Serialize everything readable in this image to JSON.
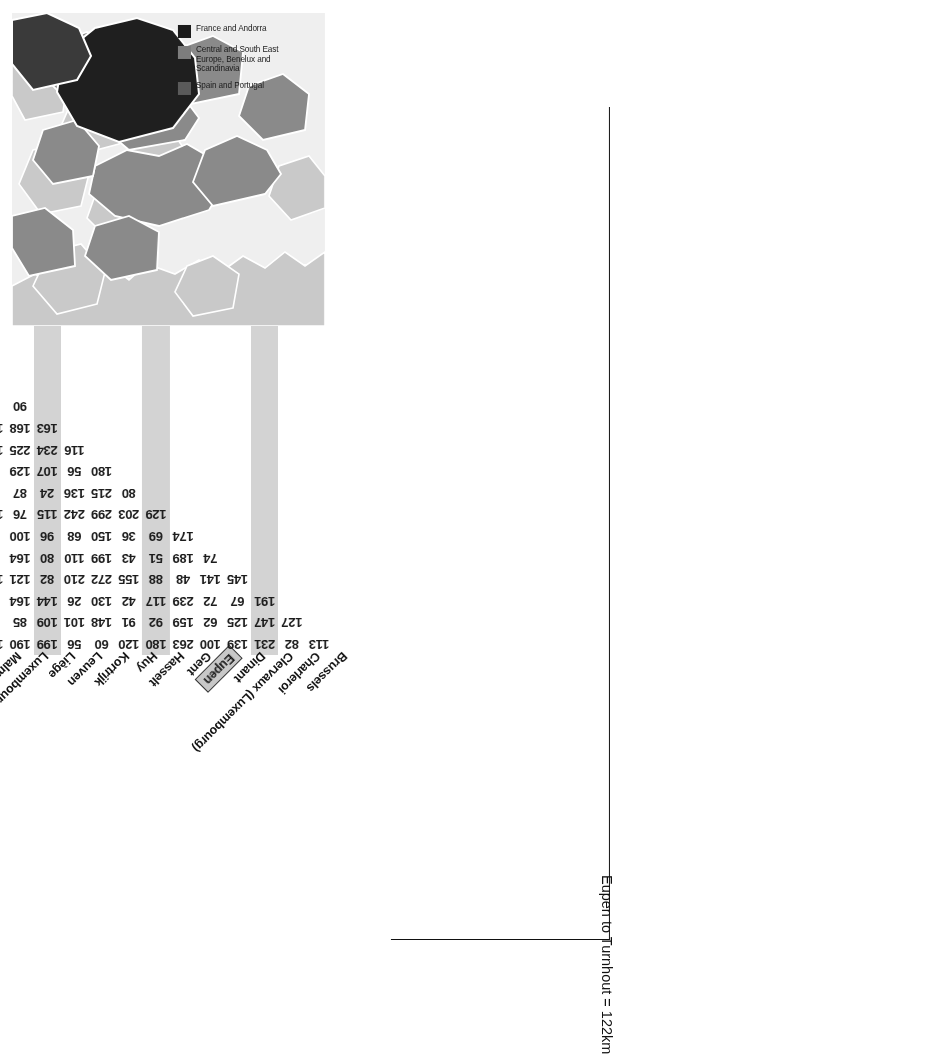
{
  "annotation": {
    "callout_text": "Eupen to Turnhout = 122km"
  },
  "map": {
    "legend": [
      {
        "label": "France and Andorra",
        "color": "#1a1a1a"
      },
      {
        "label": "Central and South East Europe, Benelux and Scandinavia",
        "color": "#7d7d7d"
      },
      {
        "label": "Spain and Portugal",
        "color": "#5a5a5a"
      }
    ],
    "colors": {
      "sea": "#efefef",
      "land_light": "#c9c9c9",
      "land_mid": "#8a8a8a",
      "land_dark": "#1f1f1f",
      "border": "#ffffff"
    }
  },
  "chart_data": {
    "type": "table",
    "highlight": {
      "row": "Turnhout",
      "column": "Eupen",
      "value": 122
    },
    "columns": [
      "Charleroi",
      "Clervaux (Luxembourg)",
      "Dinant",
      "Eupen",
      "Gent",
      "Hasselt",
      "Huy",
      "Kortrijk",
      "Leuven",
      "Liège",
      "Luxembourg City",
      "Malmedy",
      "Mechelen",
      "Mons",
      "Namur",
      "Oostende",
      "Oudenaarde",
      "Philippeville",
      "Tournai",
      "Turnhout",
      "Ypres",
      "Zeebrugge"
    ],
    "column_leftmost_partial": "Brussels",
    "rows": [
      {
        "label": "Clervaux (Luxembourg)",
        "values": [
          113,
          null,
          127,
          191,
          145,
          null,
          null,
          null,
          null,
          180,
          null,
          null,
          null,
          null,
          null,
          null,
          null,
          null,
          null,
          null,
          null,
          null
        ]
      },
      {
        "label": "Dinant",
        "values": [
          82,
          127,
          null,
          67,
          141,
          74,
          174,
          129,
          80,
          56,
          116,
          163,
          90,
          72,
          179,
          86,
          138,
          119,
          174,
          176,
          68,
          null
        ]
      },
      {
        "label": "Eupen",
        "values": [
          231,
          147,
          125,
          72,
          48,
          189,
          69,
          203,
          215,
          107,
          234,
          168,
          81,
          140,
          137,
          193,
          37,
          185,
          58,
          167,
          null,
          null
        ]
      },
      {
        "label": "Gent",
        "values": [
          139,
          125,
          62,
          239,
          88,
          51,
          36,
          299,
          136,
          129,
          225,
          102,
          137,
          67,
          62,
          91,
          127,
          175,
          113,
          null,
          null,
          null
        ]
      },
      {
        "label": "Hasselt",
        "values": [
          100,
          62,
          159,
          117,
          155,
          43,
          150,
          242,
          24,
          62,
          155,
          268,
          96,
          72,
          120,
          170,
          65,
          195,
          null,
          null,
          null,
          null
        ]
      },
      {
        "label": "Huy",
        "values": [
          263,
          159,
          92,
          42,
          272,
          199,
          68,
          115,
          87,
          214,
          329,
          226,
          115,
          48,
          146,
          56,
          86,
          null,
          null,
          null,
          null,
          null
        ]
      },
      {
        "label": "Kortrijk",
        "values": [
          180,
          92,
          91,
          130,
          210,
          110,
          96,
          76,
          62,
          172,
          310,
          130,
          116,
          160,
          175,
          25,
          null,
          null,
          null,
          null,
          null,
          null
        ]
      },
      {
        "label": "Leuven",
        "values": [
          120,
          91,
          148,
          26,
          82,
          80,
          100,
          144,
          144,
          119,
          177,
          242,
          54,
          106,
          177,
          null,
          null,
          null,
          null,
          null,
          null,
          null
        ]
      },
      {
        "label": "Liège",
        "values": [
          60,
          148,
          101,
          144,
          121,
          164,
          34,
          62,
          103,
          175,
          270,
          166,
          146,
          151,
          null,
          null,
          null,
          null,
          null,
          null,
          null,
          null
        ]
      },
      {
        "label": "Luxembourg City",
        "values": [
          56,
          101,
          109,
          164,
          120,
          97,
          198,
          35,
          94,
          105,
          304,
          272,
          137,
          null,
          null,
          null,
          null,
          null,
          null,
          null,
          null,
          null
        ]
      },
      {
        "label": "Malmedy",
        "values": [
          199,
          109,
          85,
          99,
          70,
          202,
          165,
          146,
          112,
          232,
          328,
          263,
          null,
          null,
          null,
          null,
          null,
          null,
          null,
          null,
          null,
          null
        ]
      },
      {
        "label": "Mechelen",
        "values": [
          190,
          85,
          28,
          249,
          29,
          197,
          91,
          29,
          161,
          212,
          331,
          null,
          null,
          null,
          null,
          null,
          null,
          null,
          null,
          null,
          null,
          null
        ]
      },
      {
        "label": "Mons",
        "values": [
          120,
          28,
          205,
          207,
          136,
          156,
          148,
          147,
          143,
          null,
          null,
          null,
          null,
          null,
          null,
          null,
          null,
          null,
          null,
          null,
          null,
          null
        ]
      },
      {
        "label": "Namur",
        "values": [
          294,
          205,
          164,
          155,
          71,
          211,
          171,
          74,
          null,
          null,
          null,
          null,
          null,
          null,
          null,
          null,
          null,
          null,
          null,
          null,
          null,
          null
        ]
      },
      {
        "label": "Oostende",
        "values": [
          255,
          164,
          30,
          211,
          106,
          55,
          205,
          null,
          null,
          null,
          null,
          null,
          null,
          null,
          null,
          null,
          null,
          null,
          null,
          null,
          null,
          null
        ]
      },
      {
        "label": "Oudenaarde",
        "values": [
          142,
          30,
          131,
          122,
          78,
          217,
          197,
          null,
          null,
          null,
          null,
          null,
          null,
          null,
          null,
          null,
          null,
          null,
          null,
          null,
          null,
          null
        ]
      },
      {
        "label": "Philippeville",
        "values": [
          235,
          131,
          177,
          269,
          201,
          156,
          null,
          null,
          null,
          null,
          null,
          null,
          null,
          null,
          null,
          null,
          null,
          null,
          null,
          null,
          null,
          null
        ]
      },
      {
        "label": "Tournai",
        "values": [
          344,
          177,
          189,
          70,
          null,
          null,
          null,
          null,
          null,
          null,
          null,
          null,
          null,
          null,
          null,
          null,
          null,
          null,
          null,
          null,
          null,
          null
        ]
      },
      {
        "label": "Turnhout",
        "values": [
          293,
          189,
          205,
          null,
          null,
          null,
          null,
          null,
          null,
          null,
          null,
          null,
          null,
          null,
          null,
          null,
          null,
          null,
          null,
          null,
          null,
          null
        ]
      },
      {
        "label": "Ypres",
        "values": [
          263,
          205,
          null,
          null,
          null,
          null,
          null,
          null,
          null,
          null,
          null,
          null,
          null,
          null,
          null,
          null,
          null,
          null,
          null,
          null,
          null,
          null
        ]
      }
    ],
    "matrix_render": [
      [
        "",
        "113",
        "82",
        "231",
        "139",
        "100",
        "263",
        "180",
        "120",
        "60",
        "56",
        "199",
        "190",
        "120",
        "294",
        "255",
        "142",
        "235",
        "344",
        "293",
        "263"
      ],
      [
        "",
        "",
        "127",
        "147",
        "125",
        "62",
        "159",
        "92",
        "91",
        "148",
        "101",
        "109",
        "85",
        "28",
        "205",
        "164",
        "30",
        "131",
        "177",
        "189",
        "205"
      ],
      [
        "",
        "",
        "",
        "191",
        "67",
        "72",
        "239",
        "117",
        "42",
        "130",
        "26",
        "144",
        "164",
        "99",
        "249",
        "207",
        "155",
        "211",
        "122",
        "269",
        "70"
      ],
      [
        "",
        "",
        "",
        "",
        "145",
        "141",
        "48",
        "88",
        "155",
        "272",
        "210",
        "82",
        "121",
        "120",
        "70",
        "29",
        "136",
        "71",
        "106",
        "78",
        "201"
      ],
      [
        "",
        "",
        "",
        "",
        "",
        "74",
        "189",
        "51",
        "43",
        "199",
        "110",
        "80",
        "164",
        "97",
        "202",
        "197",
        "156",
        "211",
        "55",
        "217",
        "156"
      ],
      [
        "",
        "",
        "",
        "",
        "",
        "",
        "174",
        "69",
        "36",
        "150",
        "68",
        "96",
        "100",
        "34",
        "198",
        "165",
        "91",
        "148",
        "171",
        "205",
        "197"
      ],
      [
        "",
        "",
        "",
        "",
        "",
        "",
        "",
        "129",
        "203",
        "299",
        "242",
        "115",
        "76",
        "144",
        "62",
        "35",
        "146",
        "29",
        "147",
        "29",
        "74"
      ],
      [
        "",
        "",
        "",
        "",
        "",
        "",
        "",
        "",
        "80",
        "215",
        "136",
        "24",
        "87",
        "62",
        "144",
        "103",
        "94",
        "134",
        "112",
        "161",
        "143"
      ],
      [
        "",
        "",
        "",
        "",
        "",
        "",
        "",
        "",
        "",
        "180",
        "56",
        "107",
        "129",
        "62",
        "214",
        "172",
        "119",
        "175",
        "105",
        "232",
        "212"
      ],
      [
        "",
        "",
        "",
        "",
        "",
        "",
        "",
        "",
        "",
        "",
        "116",
        "234",
        "225",
        "155",
        "329",
        "310",
        "177",
        "270",
        "304",
        "328",
        "331"
      ],
      [
        "",
        "",
        "",
        "",
        "",
        "",
        "",
        "",
        "",
        "",
        "",
        "163",
        "168",
        "102",
        "268",
        "226",
        "130",
        "242",
        "166",
        "272",
        "263"
      ],
      [
        "",
        "",
        "",
        "",
        "",
        "",
        "",
        "",
        "",
        "",
        "",
        "",
        "90",
        "81",
        "137",
        "96",
        "115",
        "116",
        "54",
        "146",
        "137"
      ],
      [
        "",
        "",
        "",
        "",
        "",
        "",
        "",
        "",
        "",
        "",
        "",
        "",
        "",
        "72",
        "140",
        "67",
        "72",
        "48",
        "160",
        "106",
        "151"
      ],
      [
        "",
        "",
        "",
        "",
        "",
        "",
        "",
        "",
        "",
        "",
        "",
        "",
        "",
        "",
        "179",
        "137",
        "62",
        "120",
        "146",
        "175",
        "177"
      ],
      [
        "",
        "",
        "",
        "",
        "",
        "",
        "",
        "",
        "",
        "",
        "",
        "",
        "",
        "",
        "",
        "86",
        "193",
        "91",
        "170",
        "56",
        "25"
      ],
      [
        "",
        "",
        "",
        "",
        "",
        "",
        "",
        "",
        "",
        "",
        "",
        "",
        "",
        "",
        "",
        "",
        "138",
        "37",
        "127",
        "65",
        "86"
      ],
      [
        "",
        "",
        "",
        "",
        "",
        "",
        "",
        "",
        "",
        "",
        "",
        "",
        "",
        "",
        "",
        "",
        "",
        "119",
        "185",
        "175",
        "195"
      ],
      [
        "",
        "",
        "",
        "",
        "",
        "",
        "",
        "",
        "",
        "",
        "",
        "",
        "",
        "",
        "",
        "",
        "",
        "",
        "174",
        "58",
        "113"
      ],
      [
        "",
        "",
        "",
        "",
        "",
        "",
        "",
        "",
        "",
        "",
        "",
        "",
        "",
        "",
        "",
        "",
        "",
        "",
        "",
        "176",
        "167"
      ],
      [
        "",
        "",
        "",
        "",
        "",
        "",
        "",
        "",
        "",
        "",
        "",
        "",
        "",
        "",
        "",
        "",
        "",
        "",
        "",
        "",
        "68"
      ]
    ],
    "diagonal_labels": [
      "Brussels",
      "Charleroi",
      "Clervaux (Luxembourg)",
      "Dinant",
      "Eupen",
      "Gent",
      "Hasselt",
      "Huy",
      "Kortrijk",
      "Leuven",
      "Liège",
      "Luxembourg City",
      "Malmedy",
      "Mechelen",
      "Mons",
      "Namur",
      "Oostende",
      "Oudenaarde",
      "Philippeville",
      "Tournai",
      "Turnhout",
      "Ypres",
      "Zeebrugge"
    ],
    "highlighted_labels": [
      "Eupen",
      "Turnhout"
    ],
    "shaded_columns": [
      3,
      7,
      11,
      15,
      19
    ],
    "ylabel": "",
    "xlabel": "",
    "grid": false,
    "legend_position": "none"
  }
}
